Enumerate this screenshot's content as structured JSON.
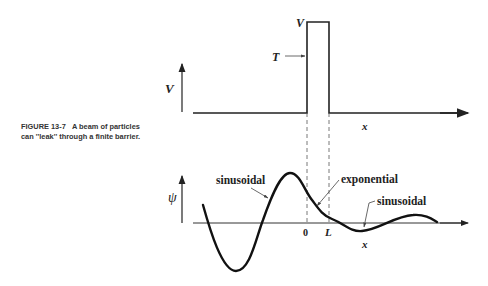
{
  "caption": {
    "figure_label": "FIGURE 13-7",
    "text": "A beam of particles can ''leak'' through a finite barrier."
  },
  "top_plot": {
    "y_axis_label": "V",
    "barrier_top_label": "V",
    "incident_label": "T",
    "x_axis_label": "x"
  },
  "bottom_plot": {
    "y_axis_label": "ψ",
    "x_axis_label": "x",
    "tick_0": "0",
    "tick_L": "L",
    "annotations": {
      "left_region": "sinusoidal",
      "barrier_region": "exponential",
      "right_region": "sinusoidal"
    }
  }
}
